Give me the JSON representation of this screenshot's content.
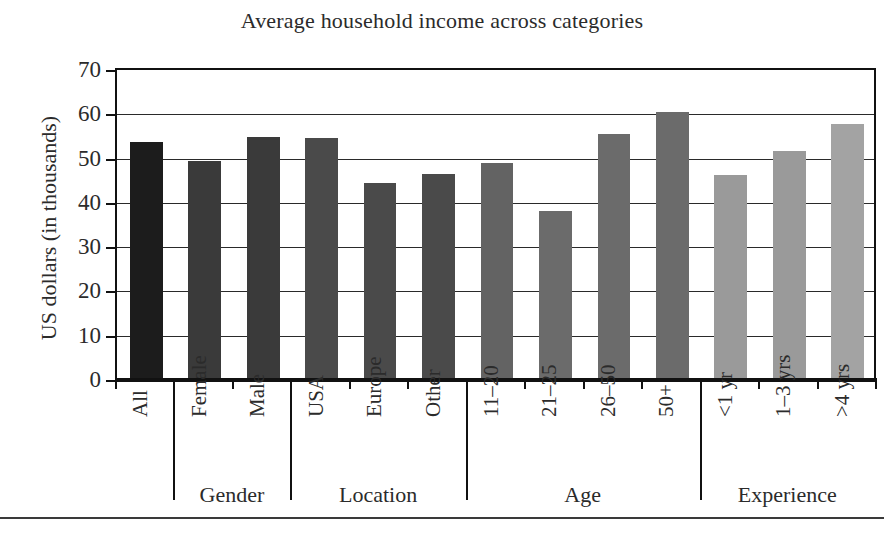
{
  "chart_data": {
    "type": "bar",
    "title": "Average household income across categories",
    "xlabel": "",
    "ylabel": "US dollars (in thousands)",
    "ylim": [
      0,
      70
    ],
    "ytick_step": 10,
    "yticks": [
      "70",
      "60",
      "50",
      "40",
      "30",
      "20",
      "10",
      "0"
    ],
    "grid": true,
    "legend": "none",
    "categories": [
      "All",
      "Female",
      "Male",
      "USA",
      "Europe",
      "Other",
      "11–20",
      "21–25",
      "26–50",
      "50+",
      "<1 yr",
      "1–3 yrs",
      ">4 yrs"
    ],
    "values": [
      53.4,
      49.0,
      54.5,
      54.2,
      44.0,
      46.0,
      48.5,
      37.8,
      55.2,
      60.0,
      45.8,
      51.3,
      57.3
    ],
    "bars": [
      {
        "label": "All",
        "value": 53.4,
        "group": "",
        "color": "#1c1c1c"
      },
      {
        "label": "Female",
        "value": 49.0,
        "group": "Gender",
        "color": "#3a3a3a"
      },
      {
        "label": "Male",
        "value": 54.5,
        "group": "Gender",
        "color": "#3a3a3a"
      },
      {
        "label": "USA",
        "value": 54.2,
        "group": "Location",
        "color": "#4a4a4a"
      },
      {
        "label": "Europe",
        "value": 44.0,
        "group": "Location",
        "color": "#4a4a4a"
      },
      {
        "label": "Other",
        "value": 46.0,
        "group": "Location",
        "color": "#4a4a4a"
      },
      {
        "label": "11–20",
        "value": 48.5,
        "group": "Age",
        "color": "#636363"
      },
      {
        "label": "21–25",
        "value": 37.8,
        "group": "Age",
        "color": "#6b6b6b"
      },
      {
        "label": "26–50",
        "value": 55.2,
        "group": "Age",
        "color": "#6b6b6b"
      },
      {
        "label": "50+",
        "value": 60.0,
        "group": "Age",
        "color": "#6b6b6b"
      },
      {
        "label": "<1 yr",
        "value": 45.8,
        "group": "Experience",
        "color": "#9a9a9a"
      },
      {
        "label": "1–3 yrs",
        "value": 51.3,
        "group": "Experience",
        "color": "#9a9a9a"
      },
      {
        "label": ">4 yrs",
        "value": 57.3,
        "group": "Experience",
        "color": "#a3a3a3"
      }
    ],
    "groups": [
      {
        "label": "Gender",
        "start_index": 1,
        "end_index": 2
      },
      {
        "label": "Location",
        "start_index": 3,
        "end_index": 5
      },
      {
        "label": "Age",
        "start_index": 6,
        "end_index": 9
      },
      {
        "label": "Experience",
        "start_index": 10,
        "end_index": 12
      }
    ]
  }
}
